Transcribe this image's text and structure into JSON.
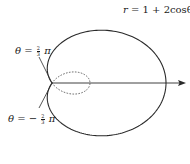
{
  "figure": {
    "curve_equation": "r = 1 + 2cosθ",
    "curve_label": {
      "lhs": "r",
      "rhs": "1 + 2cosθ"
    },
    "ray_labels": [
      {
        "lhs": "θ",
        "sign": "",
        "num": "2",
        "den": "3",
        "sym": "π"
      },
      {
        "lhs": "θ",
        "sign": "−",
        "num": "2",
        "den": "3",
        "sym": "π"
      }
    ],
    "colors": {
      "curve": "#2a2a2a",
      "axis": "#2a2a2a",
      "inner_loop": "#555555"
    }
  },
  "chart_data": {
    "type": "line",
    "title": "",
    "function": "r = 1 + 2cos(theta)",
    "outer_loop_theta_range": [
      "-2π/3",
      "2π/3"
    ],
    "inner_loop_theta_range": [
      "2π/3",
      "4π/3"
    ],
    "inner_loop_style": "dashed",
    "annotations": [
      "r = 1 + 2cosθ",
      "θ = 2/3 π",
      "θ = −2/3 π"
    ],
    "polar_axis": {
      "direction": "right",
      "arrow": true
    },
    "extent": {
      "x_max": 3,
      "inner_loop_x_max": 1
    }
  }
}
